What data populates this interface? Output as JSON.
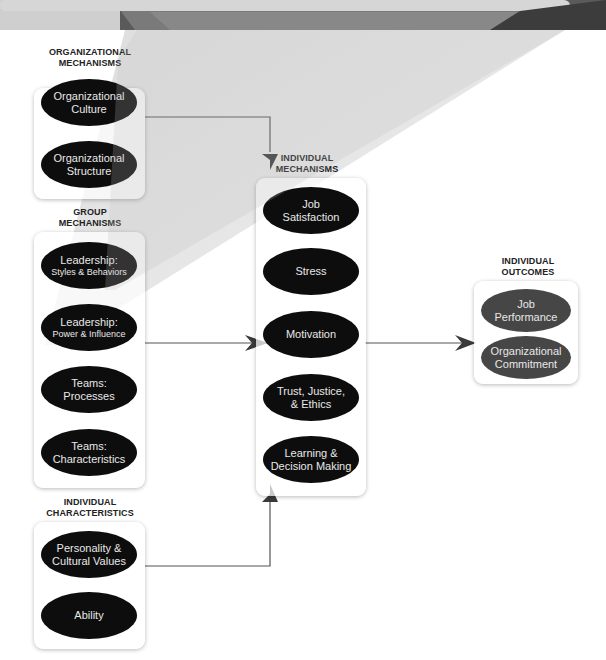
{
  "diagram": {
    "banner_color": "#4a4a4a",
    "ellipse_color": "#0d0d0d",
    "outcome_ellipse_color": "#464646",
    "sections": {
      "organizational_mechanisms": {
        "title_line1": "ORGANIZATIONAL",
        "title_line2": "MECHANISMS",
        "items": [
          {
            "line1": "Organizational",
            "line2": "Culture"
          },
          {
            "line1": "Organizational",
            "line2": "Structure"
          }
        ]
      },
      "group_mechanisms": {
        "title_line1": "GROUP",
        "title_line2": "MECHANISMS",
        "items": [
          {
            "line1": "Leadership:",
            "line2": "Styles & Behaviors"
          },
          {
            "line1": "Leadership:",
            "line2": "Power & Influence"
          },
          {
            "line1": "Teams:",
            "line2": "Processes"
          },
          {
            "line1": "Teams:",
            "line2": "Characteristics"
          }
        ]
      },
      "individual_characteristics": {
        "title_line1": "INDIVIDUAL",
        "title_line2": "CHARACTERISTICS",
        "items": [
          {
            "line1": "Personality  &",
            "line2": "Cultural Values"
          },
          {
            "line1": "Ability",
            "line2": ""
          }
        ]
      },
      "individual_mechanisms": {
        "title_line1": "INDIVIDUAL",
        "title_line2": "MECHANISMS",
        "items": [
          {
            "line1": "Job",
            "line2": "Satisfaction"
          },
          {
            "line1": "Stress",
            "line2": ""
          },
          {
            "line1": "Motivation",
            "line2": ""
          },
          {
            "line1": "Trust, Justice,",
            "line2": "& Ethics"
          },
          {
            "line1": "Learning &",
            "line2": "Decision Making"
          }
        ]
      },
      "individual_outcomes": {
        "title_line1": "INDIVIDUAL",
        "title_line2": "OUTCOMES",
        "items": [
          {
            "line1": "Job",
            "line2": "Performance"
          },
          {
            "line1": "Organizational",
            "line2": "Commitment"
          }
        ]
      }
    },
    "arrows": [
      {
        "from": "organizational_mechanisms",
        "to": "individual_mechanisms",
        "direction": "down"
      },
      {
        "from": "group_mechanisms",
        "to": "individual_mechanisms",
        "direction": "right"
      },
      {
        "from": "individual_characteristics",
        "to": "individual_mechanisms",
        "direction": "up"
      },
      {
        "from": "individual_mechanisms",
        "to": "individual_outcomes",
        "direction": "right"
      }
    ]
  }
}
